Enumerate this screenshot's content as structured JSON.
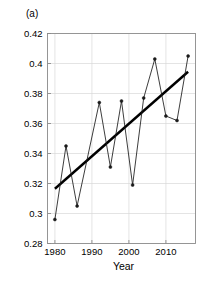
{
  "panel": {
    "label": "(a)"
  },
  "chart_data": {
    "type": "line",
    "title": "",
    "subtitle": "",
    "xlabel": "Year",
    "ylabel": "",
    "xlim": [
      1978,
      2018
    ],
    "ylim": [
      0.28,
      0.42
    ],
    "xticks": [
      1980,
      1990,
      2000,
      2010
    ],
    "xticklabels": [
      "1980",
      "1990",
      "2000",
      "2010"
    ],
    "yticks": [
      0.28,
      0.3,
      0.32,
      0.34,
      0.36,
      0.38,
      0.4,
      0.42
    ],
    "yticklabels": [
      "0.28",
      "0.3",
      "0.32",
      "0.34",
      "0.36",
      "0.38",
      "0.4",
      "0.42"
    ],
    "grid": true,
    "legend": null,
    "x": [
      1980,
      1983,
      1986,
      1992,
      1995,
      1998,
      2001,
      2004,
      2007,
      2010,
      2013,
      2016
    ],
    "series": [
      {
        "name": "observed",
        "marker": "circle",
        "color": "#1a1a1a",
        "values": [
          0.296,
          0.345,
          0.305,
          0.374,
          0.331,
          0.375,
          0.319,
          0.377,
          0.403,
          0.365,
          0.362,
          0.405
        ]
      },
      {
        "name": "linear-trend",
        "marker": "none",
        "color": "#000000",
        "x": [
          1980,
          2016
        ],
        "values": [
          0.3165,
          0.3945
        ]
      }
    ]
  }
}
